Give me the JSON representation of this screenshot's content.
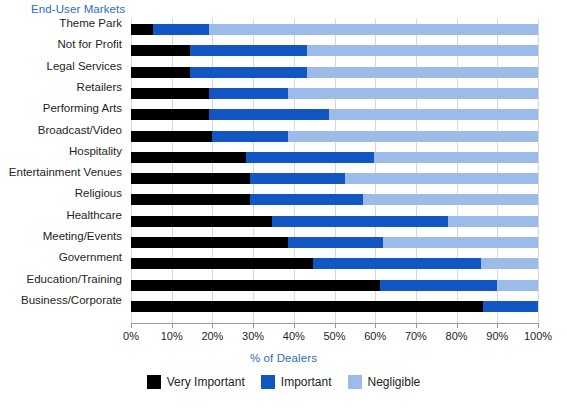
{
  "chart_data": {
    "type": "bar",
    "orientation": "horizontal",
    "stacked": true,
    "title": "",
    "xlabel": "% of Dealers",
    "ylabel": "End-User Markets",
    "xlim": [
      0,
      100
    ],
    "xticks": [
      "0%",
      "10%",
      "20%",
      "30%",
      "40%",
      "50%",
      "60%",
      "70%",
      "80%",
      "90%",
      "100%"
    ],
    "grid": true,
    "legend_position": "bottom",
    "categories": [
      "Theme Park",
      "Not for Profit",
      "Legal Services",
      "Retailers",
      "Performing Arts",
      "Broadcast/Video",
      "Hospitality",
      "Entertainment Venues",
      "Religious",
      "Healthcare",
      "Meeting/Events",
      "Government",
      "Education/Training",
      "Business/Corporate"
    ],
    "series": [
      {
        "name": "Very Important",
        "color": "#000000",
        "values": [
          5.3,
          14.5,
          14.5,
          19.2,
          19.2,
          20.0,
          28.3,
          29.2,
          29.2,
          34.6,
          38.6,
          44.7,
          61.2,
          86.5
        ]
      },
      {
        "name": "Important",
        "color": "#1256c4",
        "values": [
          13.9,
          28.7,
          28.7,
          19.4,
          29.4,
          18.6,
          31.4,
          23.4,
          27.8,
          43.3,
          23.4,
          41.3,
          28.7,
          13.5
        ]
      },
      {
        "name": "Negligible",
        "color": "#9dbbe8",
        "values": [
          80.8,
          56.8,
          56.8,
          61.4,
          51.4,
          61.4,
          40.3,
          47.4,
          43.0,
          22.1,
          38.0,
          14.0,
          10.1,
          0.0
        ]
      }
    ]
  },
  "axes": {
    "category_axis_title": "End-User Markets",
    "value_axis_title": "% of Dealers",
    "accent_color": "#2a6ebb"
  },
  "legend": {
    "items": [
      {
        "label": "Very Important",
        "color": "#000000"
      },
      {
        "label": "Important",
        "color": "#1256c4"
      },
      {
        "label": "Negligible",
        "color": "#9dbbe8"
      }
    ]
  }
}
